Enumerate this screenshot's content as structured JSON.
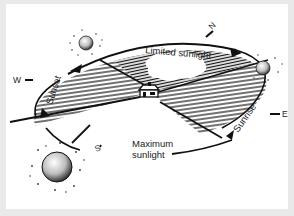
{
  "diagram": {
    "labels": {
      "limited": "Limited sunlight",
      "maximum_line1": "Maximum",
      "maximum_line2": "sunlight",
      "sunset": "Sunset",
      "sunrise": "Sunrise"
    },
    "compass": {
      "north": "N",
      "south": "S",
      "east": "E",
      "west": "W"
    },
    "icons": [
      "sun-icon",
      "house-icon",
      "arrow-icon"
    ],
    "colors": {
      "ink": "#111111",
      "paper": "#ffffff",
      "border": "#e9e9e9"
    }
  }
}
